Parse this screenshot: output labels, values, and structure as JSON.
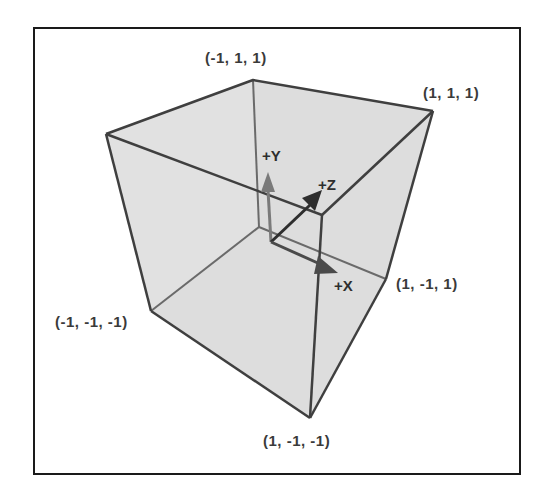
{
  "diagram": {
    "title": "",
    "type": "3d-cube-coordinate-system",
    "colors": {
      "frame": "#1a1a1a",
      "face_fill": "#dcdcdc",
      "edge": "#444444",
      "axis": "#3a3a3a",
      "label": "#3a3a3a"
    },
    "vertex_labels": {
      "back_top_left": "(-1, 1, 1)",
      "top_right": "(1, 1, 1)",
      "left_bottom": "(-1, -1, -1)",
      "right_mid": "(1, -1, 1)",
      "front_bottom": "(1, -1, -1)"
    },
    "axes": {
      "y": "+Y",
      "z": "+Z",
      "x": "+X"
    }
  }
}
